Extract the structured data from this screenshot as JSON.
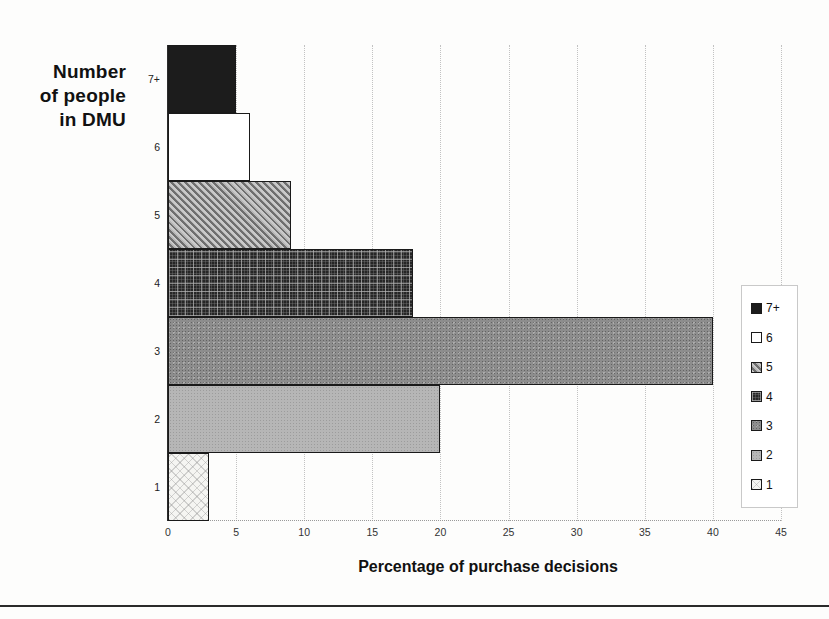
{
  "figure": {
    "bottom_rule_color": "#2a2a2a",
    "background": "#fdfdfc"
  },
  "chart_data": {
    "type": "bar",
    "orientation": "horizontal",
    "title_lines": {
      "line1": "Number",
      "line2": "of people",
      "line3": "in DMU"
    },
    "categories": [
      "7+",
      "6",
      "5",
      "4",
      "3",
      "2",
      "1"
    ],
    "values": [
      5,
      6,
      9,
      18,
      40,
      20,
      3
    ],
    "xlabel": "Percentage of purchase decisions",
    "x_ticks": [
      0,
      5,
      10,
      15,
      20,
      25,
      30,
      35,
      40,
      45
    ],
    "x_tick_labels": [
      "0",
      "5",
      "10",
      "15",
      "20",
      "25",
      "30",
      "35",
      "40",
      "45"
    ],
    "xlim": [
      0,
      45
    ],
    "grid": true,
    "gridline_color": "#c2c2c2",
    "bar_border_color": "#1a1a1a",
    "patterns": [
      "solid-black",
      "white",
      "diagonal-hatch",
      "dark-plaid",
      "gray-halftone",
      "light-gray-halftone",
      "light-diamond-lattice"
    ],
    "pattern_colors": {
      "black": "#1c1c1c",
      "dark_plaid_base": "#262626",
      "gray_3": "#8d8d8d",
      "gray_2": "#b6b6b6",
      "light_1": "#f5f5f2"
    },
    "legend": {
      "position": "right",
      "items": [
        "7+",
        "6",
        "5",
        "4",
        "3",
        "2",
        "1"
      ]
    }
  }
}
